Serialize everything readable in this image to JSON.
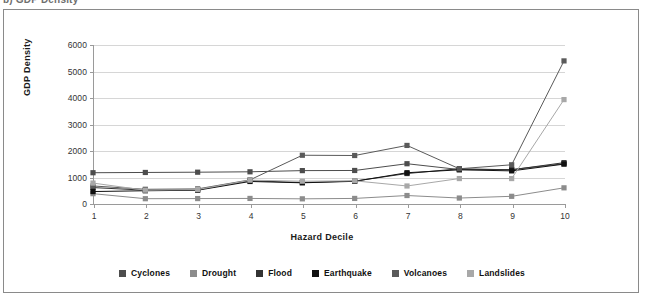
{
  "caption": {
    "text": "b)  GDP Density"
  },
  "figure": {
    "border_color": "#8a8a8a",
    "background": "#ffffff"
  },
  "legend": {
    "position": "bottom-center"
  },
  "chart_data": {
    "type": "line",
    "title": "",
    "xlabel": "Hazard Decile",
    "ylabel": "GDP Density",
    "categories": [
      "1",
      "2",
      "3",
      "4",
      "5",
      "6",
      "7",
      "8",
      "9",
      "10"
    ],
    "x": [
      1,
      2,
      3,
      4,
      5,
      6,
      7,
      8,
      9,
      10
    ],
    "xlim": [
      1,
      10
    ],
    "ylim": [
      0,
      6000
    ],
    "yticks": [
      0,
      1000,
      2000,
      3000,
      4000,
      5000,
      6000
    ],
    "ytick_labels": [
      "0",
      "1000",
      "2000",
      "3000",
      "4000",
      "5000",
      "6000"
    ],
    "grid": true,
    "grid_color": "#d6d6d6",
    "marker": "square",
    "legend_position": "bottom",
    "series": [
      {
        "name": "Cyclones",
        "color": "#4d4d4d",
        "values": [
          1180,
          1190,
          1200,
          1215,
          1260,
          1265,
          1520,
          1300,
          1300,
          1520
        ]
      },
      {
        "name": "Drought",
        "color": "#8c8c8c",
        "values": [
          390,
          200,
          205,
          210,
          195,
          210,
          320,
          225,
          290,
          610
        ]
      },
      {
        "name": "Flood",
        "color": "#333333",
        "values": [
          620,
          520,
          540,
          880,
          810,
          865,
          1150,
          1330,
          1290,
          1560
        ]
      },
      {
        "name": "Earthquake",
        "color": "#111111",
        "values": [
          470,
          500,
          520,
          850,
          800,
          855,
          1180,
          1290,
          1250,
          1505
        ]
      },
      {
        "name": "Volcanoes",
        "color": "#5a5a5a",
        "values": [
          680,
          555,
          570,
          910,
          1840,
          1830,
          2210,
          1330,
          1480,
          5400
        ]
      },
      {
        "name": "Landslides",
        "color": "#a8a8a8",
        "values": [
          790,
          520,
          545,
          900,
          860,
          875,
          680,
          960,
          960,
          3940
        ]
      }
    ]
  }
}
